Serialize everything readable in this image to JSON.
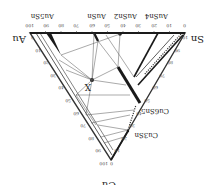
{
  "diagram": {
    "type": "ternary-phase-diagram",
    "orientation_deg": 180,
    "vertices": {
      "au": "Au",
      "sn": "Sn",
      "cu": "Cu"
    },
    "phases": {
      "au5sn": "Au5Sn",
      "ausn": "AuSn",
      "ausn2": "AuSn2",
      "ausn4": "AuSn4",
      "cu6sn5": "Cu6Sn5",
      "cu3sn": "Cu3Sn"
    },
    "marker": "X",
    "ticks_top": [
      "100",
      "90",
      "80",
      "70",
      "60",
      "50",
      "40",
      "30",
      "20",
      "10",
      "0"
    ],
    "ticks_right": [
      "100",
      "90",
      "80",
      "70",
      "60",
      "50",
      "40",
      "30",
      "20",
      "10",
      "0"
    ],
    "ticks_left": [
      "0",
      "10",
      "20",
      "30",
      "40",
      "50",
      "60",
      "70",
      "80",
      "90",
      "100"
    ],
    "colors": {
      "line": "#333333",
      "thick": "#1a1a1a",
      "background": "#ffffff"
    }
  }
}
